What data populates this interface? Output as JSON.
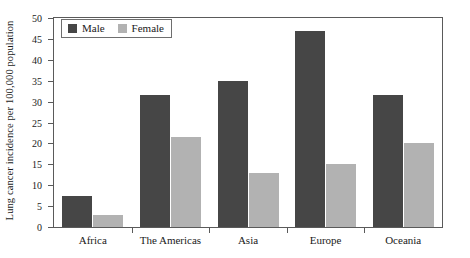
{
  "chart_data": {
    "type": "bar",
    "title": "",
    "xlabel": "",
    "ylabel": "Lung cancer incidence per 100,000 population",
    "categories": [
      "Africa",
      "The Americas",
      "Asia",
      "Europe",
      "Oceania"
    ],
    "series": [
      {
        "name": "Male",
        "color": "#464646",
        "values": [
          7.5,
          31.5,
          35.0,
          47.0,
          31.5
        ]
      },
      {
        "name": "Female",
        "color": "#b2b2b2",
        "values": [
          2.8,
          21.5,
          13.0,
          15.0,
          20.0
        ]
      }
    ],
    "ylim": [
      0,
      50
    ],
    "yticks": [
      0,
      5,
      10,
      15,
      20,
      25,
      30,
      35,
      40,
      45,
      50
    ],
    "ytick_labels": [
      "0",
      "5",
      "10",
      "15",
      "20",
      "25",
      "30",
      "35",
      "40",
      "45",
      "50"
    ],
    "grid": false,
    "legend_position": "top-left",
    "frame": true
  },
  "legend": {
    "entries": [
      {
        "label": "Male",
        "swatch": "male-color-swatch"
      },
      {
        "label": "Female",
        "swatch": "female-color-swatch"
      }
    ]
  }
}
